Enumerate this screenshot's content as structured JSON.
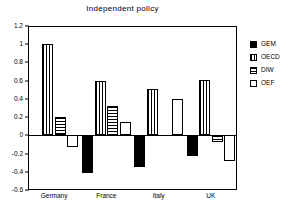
{
  "chart_data": {
    "type": "bar",
    "title": "Independent policy",
    "xlabel": "",
    "ylabel": "",
    "categories": [
      "Germany",
      "France",
      "Italy",
      "UK"
    ],
    "series": [
      {
        "name": "GEM",
        "pattern": "solid",
        "values": [
          0.0,
          -0.41,
          -0.35,
          -0.23
        ]
      },
      {
        "name": "OECD",
        "pattern": "vertical",
        "values": [
          1.0,
          0.6,
          0.51,
          0.61
        ]
      },
      {
        "name": "DIW",
        "pattern": "horizontal",
        "values": [
          0.2,
          0.32,
          0.0,
          -0.07
        ]
      },
      {
        "name": "OEF",
        "pattern": "empty",
        "values": [
          -0.13,
          0.15,
          0.4,
          -0.28
        ]
      }
    ],
    "ylim": [
      -0.6,
      1.2
    ],
    "yticks": [
      1.2,
      1,
      0.8,
      0.6,
      0.4,
      0.2,
      0,
      -0.2,
      -0.4,
      -0.6
    ],
    "ytick_labels": [
      "1.2",
      "1",
      "0.8",
      "0.6",
      "0.4",
      "0.2",
      "0",
      "-0.2",
      "-0.4",
      "-0.6"
    ],
    "grid": false,
    "legend_position": "right",
    "legend_entries": [
      "GEM",
      "OECD",
      "DIW",
      "OEF"
    ],
    "colors": {
      "axis": "#000000",
      "bar_outline": "#000000",
      "gem_fill": "#000000",
      "oecd_fill": "#ffffff",
      "diw_fill": "#ffffff",
      "oef_fill": "#ffffff",
      "background": "#ffffff"
    }
  }
}
